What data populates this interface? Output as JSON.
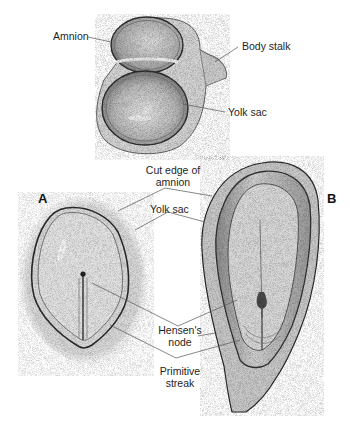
{
  "figure": {
    "top_illustration": {
      "labels": {
        "amnion": "Amnion",
        "body_stalk": "Body stalk",
        "yolk_sac": "Yolk sac"
      }
    },
    "panels": {
      "a": "A",
      "b": "B"
    },
    "shared_labels": {
      "cut_edge_line1": "Cut edge of",
      "cut_edge_line2": "amnion",
      "yolk_sac": "Yolk sac",
      "hensens_line1": "Hensen's",
      "hensens_line2": "node",
      "primitive_line1": "Primitive",
      "primitive_line2": "streak"
    },
    "colors": {
      "background": "#ffffff",
      "ink": "#1e1e1e",
      "stipple_dark": "#4a4a4a",
      "stipple_light": "#bdbdbd",
      "leader_line": "#555555"
    }
  }
}
